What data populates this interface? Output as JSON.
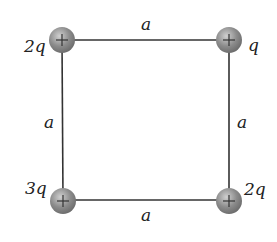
{
  "diagram": {
    "title": "",
    "shape": "square",
    "side_labels": {
      "top": "a",
      "bottom": "a",
      "left": "a",
      "right": "a"
    },
    "charges": [
      {
        "position": "top-left",
        "label": "2q",
        "sign": "+"
      },
      {
        "position": "top-right",
        "label": "q",
        "sign": "+"
      },
      {
        "position": "bottom-left",
        "label": "3q",
        "sign": "+"
      },
      {
        "position": "bottom-right",
        "label": "2q",
        "sign": "+"
      }
    ],
    "colors": {
      "line": "#333333",
      "charge_fill": "#8a8a8a",
      "charge_highlight": "#c8c8c8"
    }
  }
}
